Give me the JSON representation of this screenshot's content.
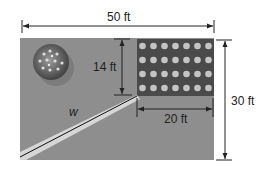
{
  "diagram": {
    "type": "geometry-figure",
    "labels": {
      "top_width": "50 ft",
      "right_height": "30 ft",
      "garden_height": "14 ft",
      "garden_width": "20 ft",
      "path": "w"
    },
    "dimensions": {
      "yard_width_ft": 50,
      "yard_height_ft": 30,
      "garden_height_ft": 14,
      "garden_width_ft": 20
    },
    "colors": {
      "yard": "#8e8e8e",
      "garden": "#4a4a4a",
      "plants": "#bdbdbd",
      "path": "#d6d6d6",
      "line": "#111111"
    },
    "elements": [
      "yard",
      "garden",
      "tree",
      "diagonal-path"
    ]
  }
}
